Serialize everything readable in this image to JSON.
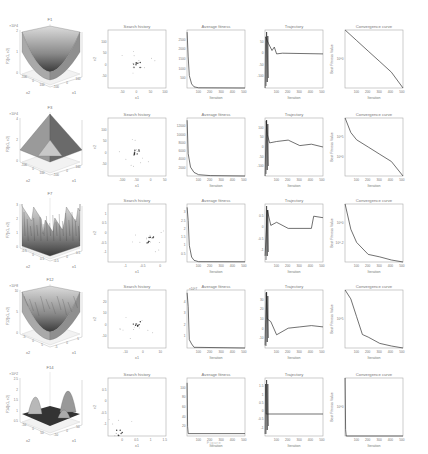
{
  "figure": {
    "rows": [
      {
        "function": {
          "title": "F1",
          "zlabel": "F1(x1, x2)",
          "zscale": "×10^4",
          "xlabel": "x1",
          "ylabel": "x2",
          "zticks": [
            "0",
            "1",
            "2"
          ],
          "xticks": [
            "-100",
            "0",
            "100"
          ],
          "yticks": [
            "-100",
            "0",
            "100"
          ],
          "shape": "bowl"
        },
        "search_history": {
          "title": "Search history",
          "xlabel": "x1",
          "ylabel": "x2",
          "xticks": [
            "-50",
            "0",
            "50",
            "100"
          ],
          "yticks": [
            "-50",
            "0",
            "50",
            "100"
          ]
        },
        "average_fitness": {
          "title": "Average fitness",
          "xlabel": "Iteration",
          "yticks": [
            "500",
            "1000",
            "1500",
            "2000",
            "2500"
          ],
          "xticks": [
            "100",
            "200",
            "300",
            "400",
            "500"
          ]
        },
        "trajectory": {
          "title": "Trajectory",
          "xlabel": "Iteration",
          "yticks": [
            "-100",
            "-50",
            "0",
            "50"
          ],
          "xticks": [
            "100",
            "200",
            "300",
            "400",
            "500"
          ]
        },
        "convergence": {
          "title": "Convergence curve",
          "xlabel": "Iteration",
          "ylabel": "Best Fitness Value",
          "yscale": "log",
          "yticks": [
            "10^0"
          ],
          "xticks": [
            "100",
            "200",
            "300",
            "400",
            "500"
          ]
        }
      },
      {
        "function": {
          "title": "F3",
          "zlabel": "F3(x1, x2)",
          "zscale": "×10^4",
          "xlabel": "x1",
          "ylabel": "x2",
          "zticks": [
            "0",
            "2",
            "4"
          ],
          "xticks": [
            "-100",
            "0",
            "100"
          ],
          "yticks": [
            "-100",
            "0",
            "100"
          ],
          "shape": "pyramid"
        },
        "search_history": {
          "title": "Search history",
          "xlabel": "x1",
          "ylabel": "x2",
          "xticks": [
            "-100",
            "-50",
            "0",
            "50"
          ],
          "yticks": [
            "-50",
            "0",
            "50",
            "100"
          ]
        },
        "average_fitness": {
          "title": "Average fitness",
          "xlabel": "Iteration",
          "yticks": [
            "2000",
            "4000",
            "6000",
            "8000",
            "10000",
            "12000"
          ],
          "xticks": [
            "100",
            "200",
            "300",
            "400",
            "500"
          ]
        },
        "trajectory": {
          "title": "Trajectory",
          "xlabel": "Iteration",
          "yticks": [
            "-100",
            "-50",
            "0",
            "50",
            "100"
          ],
          "xticks": [
            "100",
            "200",
            "300",
            "400",
            "500"
          ]
        },
        "convergence": {
          "title": "Convergence curve",
          "xlabel": "Iteration",
          "ylabel": "Best Fitness Value",
          "yscale": "log",
          "yticks": [
            "10^0",
            "10^5"
          ],
          "xticks": [
            "100",
            "200",
            "300",
            "400",
            "500"
          ]
        }
      },
      {
        "function": {
          "title": "F7",
          "zlabel": "F7(x1, x2)",
          "xlabel": "x1",
          "ylabel": "x2",
          "zticks": [
            "0",
            "1",
            "2",
            "3"
          ],
          "xticks": [
            "-0.5",
            "0",
            "0.5"
          ],
          "yticks": [
            "-0.5",
            "0",
            "0.5"
          ],
          "shape": "noisy"
        },
        "search_history": {
          "title": "Search history",
          "xlabel": "x1",
          "ylabel": "x2",
          "xticks": [
            "-1",
            "-0.5",
            "0"
          ],
          "yticks": [
            "-1",
            "-0.5",
            "0",
            "0.5",
            "1"
          ]
        },
        "average_fitness": {
          "title": "Average fitness",
          "xlabel": "Iteration",
          "yticks": [
            "0.5",
            "1",
            "1.5",
            "2",
            "2.5",
            "3"
          ],
          "xticks": [
            "100",
            "200",
            "300",
            "400",
            "500"
          ]
        },
        "trajectory": {
          "title": "Trajectory",
          "xlabel": "Iteration",
          "yticks": [
            "-1",
            "-0.5",
            "0",
            "0.5"
          ],
          "xticks": [
            "100",
            "200",
            "300",
            "400",
            "500"
          ]
        },
        "convergence": {
          "title": "Convergence curve",
          "xlabel": "Iteration",
          "ylabel": "Best Fitness Value",
          "yscale": "log",
          "yticks": [
            "10^-2",
            "10^0"
          ],
          "xticks": [
            "100",
            "200",
            "300",
            "400",
            "500"
          ]
        }
      },
      {
        "function": {
          "title": "F12",
          "zlabel": "F12(x1, x2)",
          "zscale": "×10^8",
          "xlabel": "x1",
          "ylabel": "x2",
          "zticks": [
            "0",
            "5",
            "10"
          ],
          "xticks": [
            "-5",
            "0",
            "5"
          ],
          "yticks": [
            "-5",
            "0",
            "5"
          ],
          "shape": "bowl-rough"
        },
        "search_history": {
          "title": "Search history",
          "xlabel": "x1",
          "ylabel": "x2",
          "xticks": [
            "-10",
            "0",
            "10"
          ],
          "yticks": [
            "-10",
            "0",
            "10",
            "20"
          ]
        },
        "average_fitness": {
          "title": "Average fitness",
          "yscale": "×10^7",
          "xlabel": "Iteration",
          "yticks": [
            "1",
            "2",
            "3",
            "4"
          ],
          "xticks": [
            "100",
            "200",
            "300",
            "400",
            "500"
          ]
        },
        "trajectory": {
          "title": "Trajectory",
          "xlabel": "Iteration",
          "yticks": [
            "-10",
            "0",
            "10",
            "20",
            "30"
          ],
          "xticks": [
            "100",
            "200",
            "300",
            "400",
            "500"
          ]
        },
        "convergence": {
          "title": "Convergence curve",
          "xlabel": "Iteration",
          "ylabel": "Best Fitness Value",
          "yscale": "log",
          "yticks": [
            "10^5"
          ],
          "xticks": [
            "100",
            "200",
            "300",
            "400",
            "500"
          ]
        }
      },
      {
        "function": {
          "title": "F14",
          "zlabel": "F14(x1, x2)",
          "zscale": "×10^2",
          "xlabel": "x1",
          "ylabel": "x2",
          "zticks": [
            "0.5",
            "1",
            "1.5",
            "2",
            "2.5"
          ],
          "xticks": [
            "-50",
            "0",
            "50"
          ],
          "yticks": [
            "-50",
            "0",
            "50"
          ],
          "shape": "peaks"
        },
        "search_history": {
          "title": "Search history",
          "xlabel": "x1",
          "ylabel": "x2",
          "xticks": [
            "0",
            "0.5",
            "1",
            "1.5"
          ],
          "yticks": [
            "-1",
            "-0.5",
            "0",
            "0.5"
          ]
        },
        "average_fitness": {
          "title": "Average fitness",
          "xlabel": "Iteration",
          "yticks": [
            "20",
            "40",
            "60",
            "80",
            "100"
          ],
          "xticks": [
            "100",
            "200",
            "300",
            "400",
            "500"
          ]
        },
        "trajectory": {
          "title": "Trajectory",
          "xlabel": "Iteration",
          "yticks": [
            "-1",
            "-0.5",
            "0",
            "0.5",
            "1",
            "1.5"
          ],
          "xticks": [
            "100",
            "200",
            "300",
            "400",
            "500"
          ]
        },
        "convergence": {
          "title": "Convergence curve",
          "xlabel": "Iteration",
          "ylabel": "Best Fitness Value",
          "yscale": "log",
          "yticks": [
            "10^0"
          ],
          "xticks": [
            "100",
            "200",
            "300",
            "400",
            "500"
          ]
        }
      }
    ],
    "caption": "Figure"
  },
  "chart_data": [
    {
      "type": "line",
      "title": "Average fitness (F1)",
      "xlabel": "Iteration",
      "ylabel": "",
      "x": [
        1,
        10,
        20,
        40,
        60,
        100,
        500
      ],
      "values": [
        2700,
        1500,
        600,
        200,
        60,
        10,
        0
      ],
      "ylim": [
        0,
        2800
      ],
      "xlim": [
        0,
        500
      ]
    },
    {
      "type": "line",
      "title": "Trajectory (F1)",
      "xlabel": "Iteration",
      "x": [
        1,
        5,
        30,
        60,
        80,
        100,
        150,
        500
      ],
      "values": [
        -100,
        50,
        30,
        10,
        20,
        0,
        2,
        0
      ],
      "ylim": [
        -100,
        70
      ],
      "xlim": [
        0,
        500
      ]
    },
    {
      "type": "line",
      "title": "Convergence curve (F1)",
      "xlabel": "Iteration",
      "ylabel": "Best Fitness Value",
      "yscale": "log",
      "x": [
        1,
        100,
        200,
        300,
        400,
        500
      ],
      "values": [
        1000000.0,
        10000.0,
        100.0,
        1.0,
        0.01,
        1e-05
      ],
      "xlim": [
        0,
        500
      ]
    },
    {
      "type": "line",
      "title": "Average fitness (F3)",
      "xlabel": "Iteration",
      "x": [
        1,
        10,
        30,
        60,
        100,
        200,
        500
      ],
      "values": [
        12500,
        5000,
        2000,
        800,
        300,
        100,
        0
      ],
      "ylim": [
        0,
        13000
      ],
      "xlim": [
        0,
        500
      ]
    },
    {
      "type": "line",
      "title": "Trajectory (F3)",
      "xlabel": "Iteration",
      "x": [
        1,
        10,
        20,
        40,
        100,
        200,
        300,
        400,
        500
      ],
      "values": [
        -100,
        100,
        50,
        20,
        25,
        30,
        10,
        15,
        5
      ],
      "ylim": [
        -100,
        110
      ],
      "xlim": [
        0,
        500
      ]
    },
    {
      "type": "line",
      "title": "Convergence curve (F3)",
      "xlabel": "Iteration",
      "ylabel": "Best Fitness Value",
      "yscale": "log",
      "x": [
        1,
        50,
        100,
        200,
        300,
        400,
        500
      ],
      "values": [
        100000000.0,
        1000000.0,
        100000.0,
        10000.0,
        1000.0,
        100.0,
        1.0
      ],
      "xlim": [
        0,
        500
      ]
    },
    {
      "type": "line",
      "title": "Average fitness (F7)",
      "xlabel": "Iteration",
      "x": [
        1,
        10,
        20,
        40,
        60,
        100,
        500
      ],
      "values": [
        3.3,
        2.5,
        1.0,
        0.3,
        0.1,
        0.02,
        0.01
      ],
      "ylim": [
        0,
        3.5
      ],
      "xlim": [
        0,
        500
      ]
    },
    {
      "type": "line",
      "title": "Trajectory (F7)",
      "xlabel": "Iteration",
      "x": [
        1,
        20,
        50,
        100,
        200,
        400,
        420,
        500
      ],
      "values": [
        -1,
        0.5,
        0,
        0.1,
        -0.1,
        -0.1,
        0.3,
        0.25
      ],
      "ylim": [
        -1.2,
        0.7
      ],
      "xlim": [
        0,
        500
      ]
    },
    {
      "type": "line",
      "title": "Convergence curve (F7)",
      "xlabel": "Iteration",
      "ylabel": "Best Fitness Value",
      "yscale": "log",
      "x": [
        1,
        50,
        100,
        200,
        300,
        400,
        500
      ],
      "values": [
        1,
        0.1,
        0.03,
        0.01,
        0.008,
        0.006,
        0.005
      ],
      "xlim": [
        0,
        500
      ]
    },
    {
      "type": "line",
      "title": "Average fitness (F12)",
      "xlabel": "Iteration",
      "ylabel": "×10^7",
      "x": [
        1,
        10,
        20,
        40,
        60,
        500
      ],
      "values": [
        4,
        3,
        0.6,
        0.3,
        0.05,
        0
      ],
      "ylim": [
        0,
        4.2
      ],
      "xlim": [
        0,
        500
      ]
    },
    {
      "type": "line",
      "title": "Trajectory (F12)",
      "xlabel": "Iteration",
      "x": [
        1,
        10,
        20,
        50,
        100,
        200,
        300,
        400,
        500
      ],
      "values": [
        -10,
        30,
        10,
        8,
        -2,
        3,
        4,
        5,
        4
      ],
      "ylim": [
        -12,
        32
      ],
      "xlim": [
        0,
        500
      ]
    },
    {
      "type": "line",
      "title": "Convergence curve (F12)",
      "xlabel": "Iteration",
      "ylabel": "Best Fitness Value",
      "yscale": "log",
      "x": [
        1,
        50,
        100,
        150,
        200,
        300,
        400,
        500
      ],
      "values": [
        100000000.0,
        10000000.0,
        100000.0,
        1000.0,
        500,
        100,
        50,
        30
      ],
      "xlim": [
        0,
        500
      ]
    },
    {
      "type": "line",
      "title": "Average fitness (F14)",
      "xlabel": "Iteration",
      "x": [
        1,
        5,
        10,
        500
      ],
      "values": [
        110,
        20,
        5,
        5
      ],
      "ylim": [
        0,
        120
      ],
      "xlim": [
        0,
        500
      ]
    },
    {
      "type": "line",
      "title": "Trajectory (F14)",
      "xlabel": "Iteration",
      "x": [
        1,
        5,
        10,
        20,
        500
      ],
      "values": [
        -1,
        1.5,
        0,
        0,
        0
      ],
      "ylim": [
        -1.1,
        1.8
      ],
      "xlim": [
        0,
        500
      ]
    },
    {
      "type": "line",
      "title": "Convergence curve (F14)",
      "xlabel": "Iteration",
      "ylabel": "Best Fitness Value",
      "yscale": "log",
      "x": [
        1,
        5,
        10,
        500
      ],
      "values": [
        500,
        2,
        1,
        1
      ],
      "xlim": [
        0,
        500
      ]
    }
  ]
}
